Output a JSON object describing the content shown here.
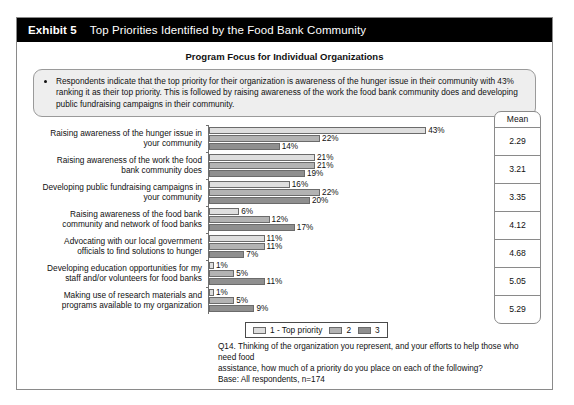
{
  "header": {
    "exhibit_number": "Exhibit 5",
    "title": "Top Priorities Identified by the Food Bank Community"
  },
  "chart_title": "Program Focus for Individual Organizations",
  "callout": {
    "bullets": [
      "Respondents indicate that the top priority for their organization is awareness of the hunger issue in their community with 43% ranking it as their top priority. This is followed by raising awareness of the work the food bank community does and developing public fundraising campaigns in their community."
    ]
  },
  "mean_column": {
    "header": "Mean",
    "values": [
      "2.29",
      "3.21",
      "3.35",
      "4.12",
      "4.68",
      "5.05",
      "5.29"
    ]
  },
  "legend": {
    "items": [
      {
        "label": "1 - Top priority",
        "color": "#dedede"
      },
      {
        "label": "2",
        "color": "#b3b3b3"
      },
      {
        "label": "3",
        "color": "#8f8f8f"
      }
    ]
  },
  "footnote": {
    "lines": [
      "Q14. Thinking of the organization you represent, and your efforts to help those who need food",
      "assistance, how much of a priority do you place on each of the following?",
      "Base: All respondents, n=174"
    ]
  },
  "chart_data": {
    "type": "bar",
    "orientation": "horizontal",
    "title": "Program Focus for Individual Organizations",
    "xlabel": "",
    "ylabel": "",
    "xlim": [
      0,
      43
    ],
    "grid": false,
    "legend_position": "bottom",
    "categories": [
      "Raising awareness of the hunger issue in your community",
      "Raising awareness of the work the food bank community does",
      "Developing public fundraising campaigns in your community",
      "Raising awareness of the food bank community and network of food banks",
      "Advocating with our local government officials to find solutions to hunger",
      "Developing education opportunities for my staff and/or volunteers for food banks",
      "Making use of research materials and programs available to my organization"
    ],
    "category_lines": [
      [
        "Raising awareness of the hunger issue in",
        "your community"
      ],
      [
        "Raising awareness of the work the food",
        "bank community does"
      ],
      [
        "Developing public fundraising campaigns in",
        "your community"
      ],
      [
        "Raising awareness of the food bank",
        "community and network of food banks"
      ],
      [
        "Advocating with our local government",
        "officials to find solutions to hunger"
      ],
      [
        "Developing education opportunities for my",
        "staff and/or volunteers for food banks"
      ],
      [
        "Making use of research materials and",
        "programs available to my organization"
      ]
    ],
    "series": [
      {
        "name": "1 - Top priority",
        "color": "#dedede",
        "values": [
          43,
          21,
          16,
          6,
          11,
          1,
          1
        ],
        "labels": [
          "43%",
          "21%",
          "16%",
          "6%",
          "11%",
          "1%",
          "1%"
        ]
      },
      {
        "name": "2",
        "color": "#b3b3b3",
        "values": [
          22,
          21,
          22,
          12,
          11,
          5,
          5
        ],
        "labels": [
          "22%",
          "21%",
          "22%",
          "12%",
          "11%",
          "5%",
          "5%"
        ]
      },
      {
        "name": "3",
        "color": "#8f8f8f",
        "values": [
          14,
          19,
          20,
          17,
          7,
          11,
          9
        ],
        "labels": [
          "14%",
          "19%",
          "20%",
          "17%",
          "7%",
          "11%",
          "9%"
        ]
      }
    ],
    "means": [
      2.29,
      3.21,
      3.35,
      4.12,
      4.68,
      5.05,
      5.29
    ]
  }
}
